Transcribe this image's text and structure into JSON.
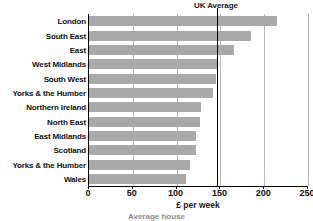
{
  "chart_data": {
    "type": "bar",
    "orientation": "horizontal",
    "title": "",
    "xlabel": "£ per week",
    "ylabel": "",
    "xlim": [
      0,
      250
    ],
    "xticks": [
      0,
      50,
      100,
      150,
      200,
      250
    ],
    "xtick_labels": [
      "0",
      "50",
      "100",
      "150",
      "200",
      "250"
    ],
    "grid": true,
    "grid_axis": "x",
    "legend": false,
    "bar_color": "#a9a9a9",
    "categories": [
      "London",
      "South East",
      "East",
      "West Midlands",
      "South West",
      "Yorks & the Humber",
      "Northern Ireland",
      "North East",
      "East Midlands",
      "Scotland",
      "Yorks & the Humber",
      "Wales"
    ],
    "values": [
      215,
      185,
      165,
      147,
      145,
      142,
      128,
      127,
      122,
      122,
      115,
      111
    ],
    "annotations": [
      {
        "label": "UK Average",
        "type": "vline",
        "value": 146
      }
    ]
  },
  "caption": {
    "text": "Average house"
  }
}
